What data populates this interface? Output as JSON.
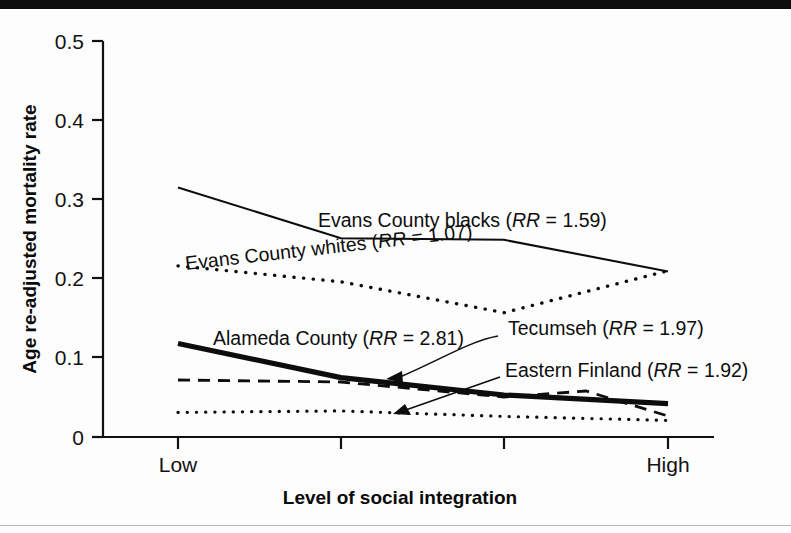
{
  "figure": {
    "background_color": "#fdfdfd",
    "top_bar_color": "#0c0c0c",
    "line_color": "#0d0d0d"
  },
  "chart_data": {
    "type": "line",
    "title": "",
    "subtitle": "",
    "xlabel": "Level of social integration",
    "ylabel": "Age re-adjusted mortality rate",
    "grid": false,
    "legend_position": "inline-annotations",
    "x": [
      1,
      2,
      3,
      4
    ],
    "xtick_labels": [
      "Low",
      "",
      "",
      "High"
    ],
    "xlim": [
      0.6,
      4.4
    ],
    "ylim": [
      0,
      0.5
    ],
    "ytick_labels": [
      "0",
      "0.1",
      "0.2",
      "0.3",
      "0.4",
      "0.5"
    ],
    "ytick_values": [
      0,
      0.1,
      0.2,
      0.3,
      0.4,
      0.5
    ],
    "series": [
      {
        "name": "Evans County blacks",
        "rr_prefix": "RR",
        "rr_value": "1.59",
        "label": "Evans County blacks (RR = 1.59)",
        "style": "solid",
        "stroke_width": 2.1,
        "values": [
          0.315,
          0.251,
          0.249,
          0.209
        ]
      },
      {
        "name": "Evans County whites",
        "rr_prefix": "RR",
        "rr_value": "1.07",
        "label": "Evans County whites (RR = 1.07)",
        "style": "dotted",
        "stroke_width": 3.4,
        "values": [
          0.216,
          0.196,
          0.157,
          0.21
        ]
      },
      {
        "name": "Alameda County",
        "rr_prefix": "RR",
        "rr_value": "2.81",
        "label": "Alameda County (RR = 2.81)",
        "style": "thick-solid",
        "stroke_width": 5.2,
        "values": [
          0.118,
          0.075,
          0.053,
          0.042
        ]
      },
      {
        "name": "Tecumseh",
        "rr_prefix": "RR",
        "rr_value": "1.97",
        "label": "Tecumseh (RR = 1.97)",
        "style": "dashed",
        "stroke_width": 2.6,
        "values": [
          0.074,
          0.072,
          0.051,
          0.026
        ]
      },
      {
        "name": "Eastern Finland",
        "rr_prefix": "RR",
        "rr_value": "1.92",
        "label": "Eastern Finland (RR = 1.92)",
        "style": "dotted",
        "stroke_width": 3.2,
        "values": [
          0.031,
          0.033,
          0.026,
          0.021
        ]
      }
    ],
    "annotations": [
      {
        "text": "Evans County blacks (RR = 1.59)",
        "target_series": "Evans County blacks",
        "leader": false
      },
      {
        "text": "Evans County whites (RR = 1.07)",
        "target_series": "Evans County whites",
        "leader": false
      },
      {
        "text": "Alameda County (RR = 2.81)",
        "target_series": "Alameda County",
        "leader": false
      },
      {
        "text": "Tecumseh (RR = 1.97)",
        "target_series": "Tecumseh",
        "leader": true
      },
      {
        "text": "Eastern Finland (RR = 1.92)",
        "target_series": "Eastern Finland",
        "leader": true
      }
    ]
  },
  "labels": {
    "y_0": "0",
    "y_1": "0.1",
    "y_2": "0.2",
    "y_3": "0.3",
    "y_4": "0.4",
    "y_5": "0.5",
    "x_low": "Low",
    "x_high": "High",
    "x_axis_title": "Level of social integration",
    "y_axis_title": "Age re-adjusted mortality rate",
    "ann_blacks_name": "Evans County blacks (",
    "ann_blacks_rr": "RR",
    "ann_blacks_tail": " = 1.59)",
    "ann_whites_name": "Evans County whites (",
    "ann_whites_rr": "RR",
    "ann_whites_tail": " = 1.07)",
    "ann_alameda_name": "Alameda County (",
    "ann_alameda_rr": "RR",
    "ann_alameda_tail": " = 2.81)",
    "ann_tecumseh_name": "Tecumseh (",
    "ann_tecumseh_rr": "RR",
    "ann_tecumseh_tail": " = 1.97)",
    "ann_finland_name": "Eastern Finland (",
    "ann_finland_rr": "RR",
    "ann_finland_tail": " = 1.92)"
  }
}
